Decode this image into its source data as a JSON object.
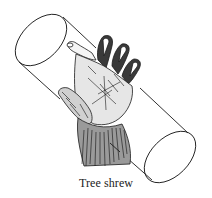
{
  "figure": {
    "caption": "Tree shrew",
    "colors": {
      "ink": "#1a1a1a",
      "background": "#ffffff"
    }
  }
}
